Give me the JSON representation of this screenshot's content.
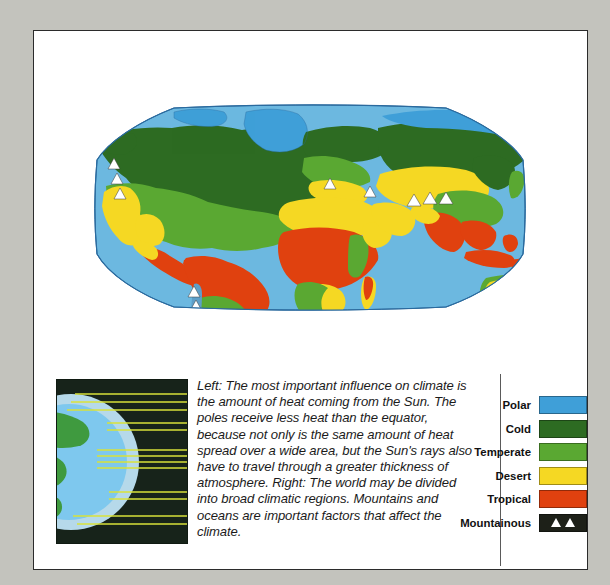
{
  "figure": {
    "caption": "Left: The most important influence on climate is the amount of heat coming from the Sun. The poles receive less heat than the equator, because not only is the same amount of heat spread over a wide area, but the Sun's rays also have to travel through a greater thickness of atmosphere. Right: The world may be divided into broad climatic regions. Mountains and oceans are important factors that affect the climate."
  },
  "map": {
    "type": "world-climate-map",
    "projection": "truncated-oval",
    "ocean_color": "#6cb8e0",
    "outline_color": "#1d4f78",
    "regions": [
      {
        "name": "Polar",
        "color": "#3f9fd8"
      },
      {
        "name": "Cold",
        "color": "#2d6b22"
      },
      {
        "name": "Temperate",
        "color": "#5aa832"
      },
      {
        "name": "Desert",
        "color": "#f5d823"
      },
      {
        "name": "Tropical",
        "color": "#e0410f"
      },
      {
        "name": "Mountainous",
        "color": "#1d2018"
      }
    ]
  },
  "diagram": {
    "background": "#17231a",
    "ray_color": "#d9e23a",
    "globe_land_color": "#3f9a3f",
    "globe_sea_color": "#7ec8ee",
    "globe_halo_color": "#bfe4f5",
    "ray_count": 13
  },
  "legend": {
    "items": [
      {
        "label": "Polar",
        "color": "#3f9fd8",
        "icon": "color-swatch"
      },
      {
        "label": "Cold",
        "color": "#2d6b22",
        "icon": "color-swatch"
      },
      {
        "label": "Temperate",
        "color": "#5aa832",
        "icon": "color-swatch"
      },
      {
        "label": "Desert",
        "color": "#f5d823",
        "icon": "color-swatch"
      },
      {
        "label": "Tropical",
        "color": "#e0410f",
        "icon": "color-swatch"
      },
      {
        "label": "Mountainous",
        "color": "#1d2018",
        "icon": "mountain-triangles-icon"
      }
    ]
  }
}
